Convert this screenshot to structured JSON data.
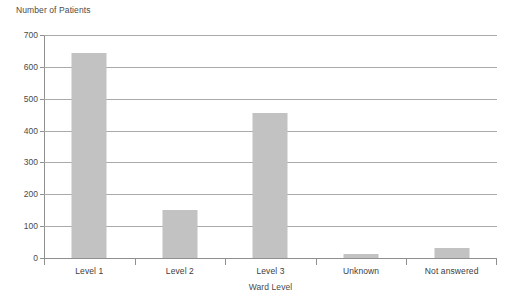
{
  "chart_data": {
    "type": "bar",
    "title": "",
    "xlabel": "Ward Level",
    "ylabel": "Number of Patients",
    "categories": [
      "Level 1",
      "Level 2",
      "Level 3",
      "Unknown",
      "Not answered"
    ],
    "values": [
      643,
      150,
      455,
      14,
      30
    ],
    "series": [
      {
        "name": "Number of Patients",
        "values": [
          643,
          150,
          455,
          14,
          30
        ]
      }
    ],
    "ylim": [
      0,
      700
    ],
    "ytick_labels": [
      "0",
      "100",
      "200",
      "300",
      "400",
      "500",
      "600",
      "700"
    ],
    "ytick_values": [
      0,
      100,
      200,
      300,
      400,
      500,
      600,
      700
    ],
    "grid": true,
    "legend": false,
    "bar_color": "#c2c2c2",
    "gridline_color": "#aaaaaa",
    "axis_color": "#8f8f8f",
    "text_color": "#3c3c3c",
    "background": "#ffffff"
  }
}
